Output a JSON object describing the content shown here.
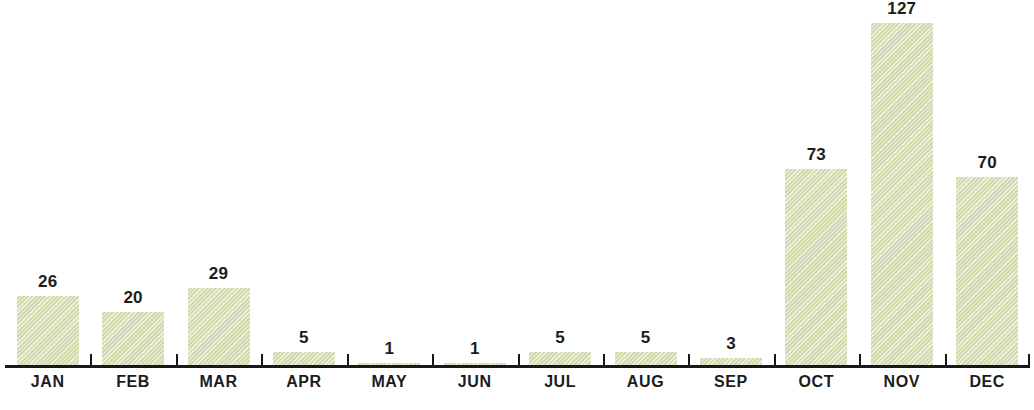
{
  "chart_data": {
    "type": "bar",
    "title": "",
    "subtitle": "",
    "xlabel": "",
    "ylabel": "",
    "categories": [
      "JAN",
      "FEB",
      "MAR",
      "APR",
      "MAY",
      "JUN",
      "JUL",
      "AUG",
      "SEP",
      "OCT",
      "NOV",
      "DEC"
    ],
    "values": [
      26,
      20,
      29,
      5,
      1,
      1,
      5,
      5,
      3,
      73,
      127,
      70
    ],
    "value_labels": [
      "26",
      "20",
      "29",
      "5",
      "1",
      "1",
      "5",
      "5",
      "3",
      "73",
      "127",
      "70"
    ],
    "ylim": [
      0,
      135
    ],
    "grid": false,
    "legend": false,
    "legend_position": "none",
    "annotations": [
      "data labels shown above each bar"
    ]
  },
  "style": {
    "bar_color": "#dfe3bc",
    "bar_edge_color": "#d3d8ae",
    "axis_color": "#16181a",
    "label_color": "#1c1c1c",
    "background_color": "#ffffff"
  },
  "footer": {
    "caption": ""
  }
}
